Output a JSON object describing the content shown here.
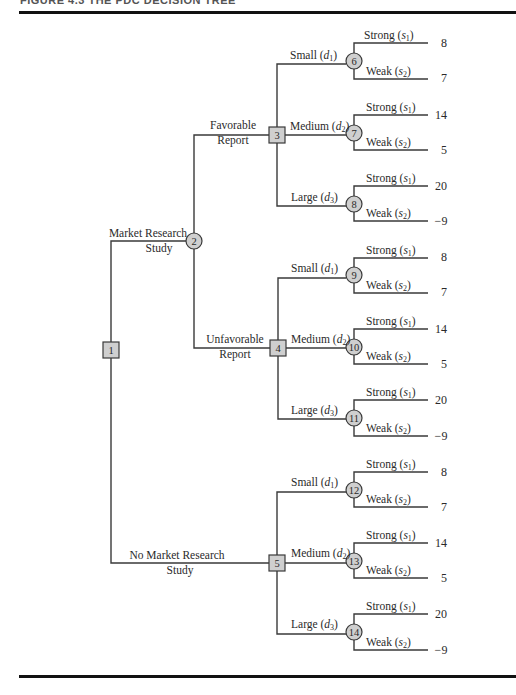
{
  "figure": {
    "caption": "FIGURE 4.3   THE PDC DECISION TREE"
  },
  "colors": {
    "line": "#3a3a3a",
    "node_fill": "#cfcfcf",
    "rule": "#111111",
    "background": "#ffffff"
  },
  "nodes": {
    "n1": {
      "label": "1",
      "type": "decision"
    },
    "n2": {
      "label": "2",
      "type": "chance"
    },
    "n3": {
      "label": "3",
      "type": "decision"
    },
    "n4": {
      "label": "4",
      "type": "decision"
    },
    "n5": {
      "label": "5",
      "type": "decision"
    },
    "n6": {
      "label": "6",
      "type": "chance"
    },
    "n7": {
      "label": "7",
      "type": "chance"
    },
    "n8": {
      "label": "8",
      "type": "chance"
    },
    "n9": {
      "label": "9",
      "type": "chance"
    },
    "n10": {
      "label": "10",
      "type": "chance"
    },
    "n11": {
      "label": "11",
      "type": "chance"
    },
    "n12": {
      "label": "12",
      "type": "chance"
    },
    "n13": {
      "label": "13",
      "type": "chance"
    },
    "n14": {
      "label": "14",
      "type": "chance"
    }
  },
  "branches": {
    "market_research": {
      "line1": "Market Research",
      "line2": "Study"
    },
    "no_market_research": {
      "line1": "No Market Research",
      "line2": "Study"
    },
    "favorable": {
      "line1": "Favorable",
      "line2": "Report"
    },
    "unfavorable": {
      "line1": "Unfavorable",
      "line2": "Report"
    },
    "small": {
      "word": "Small (",
      "var": "d",
      "sub": "1",
      "close": ")"
    },
    "medium": {
      "word": "Medium (",
      "var": "d",
      "sub": "2",
      "close": ")"
    },
    "large": {
      "word": "Large (",
      "var": "d",
      "sub": "3",
      "close": ")"
    },
    "strong": {
      "word": "Strong (",
      "var": "s",
      "sub": "1",
      "close": ")"
    },
    "weak": {
      "word": "Weak (",
      "var": "s",
      "sub": "2",
      "close": ")"
    }
  },
  "payoffs": {
    "n6": {
      "strong": "8",
      "weak": "7"
    },
    "n7": {
      "strong": "14",
      "weak": "5"
    },
    "n8": {
      "strong": "20",
      "weak": "−9"
    },
    "n9": {
      "strong": "8",
      "weak": "7"
    },
    "n10": {
      "strong": "14",
      "weak": "5"
    },
    "n11": {
      "strong": "20",
      "weak": "−9"
    },
    "n12": {
      "strong": "8",
      "weak": "7"
    },
    "n13": {
      "strong": "14",
      "weak": "5"
    },
    "n14": {
      "strong": "20",
      "weak": "−9"
    }
  }
}
